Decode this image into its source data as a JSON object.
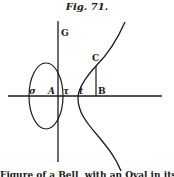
{
  "figure": {
    "title": "Fig. 71.",
    "labels": {
      "G": "G",
      "C": "C",
      "sigma": "σ",
      "A": "A",
      "tau": "τ",
      "t": "t",
      "B": "B"
    },
    "caption": "Figure of a Bell, with an Oval in its Head"
  }
}
